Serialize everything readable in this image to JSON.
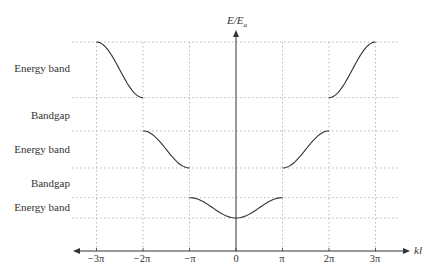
{
  "chart_data": {
    "type": "line",
    "title": "",
    "xlabel": "kl",
    "ylabel": "E/E_a",
    "x_ticks": [
      "−3π",
      "−2π",
      "−π",
      "0",
      "π",
      "2π",
      "3π"
    ],
    "x_tick_values": [
      -3,
      -2,
      -1,
      0,
      1,
      2,
      3
    ],
    "x_unit": "π",
    "grid": "dotted",
    "row_labels": [
      "Energy band",
      "Bandgap",
      "Energy band",
      "Bandgap",
      "Energy band"
    ],
    "energy_levels_relative": {
      "band3_top": 1.0,
      "band3_bottom": 0.7,
      "band2_top": 0.52,
      "band2_bottom": 0.32,
      "band1_top": 0.16,
      "band1_bottom": 0.05
    },
    "series": [
      {
        "name": "Band 1 (first zone)",
        "x_pi": [
          -1,
          0,
          1
        ],
        "shape": "cosine",
        "y_rel": [
          0.16,
          0.05,
          0.16
        ]
      },
      {
        "name": "Band 2 (left)",
        "x_pi": [
          -2,
          -1
        ],
        "shape": "cosine",
        "y_rel": [
          0.52,
          0.32
        ]
      },
      {
        "name": "Band 2 (right)",
        "x_pi": [
          1,
          2
        ],
        "shape": "cosine",
        "y_rel": [
          0.32,
          0.52
        ]
      },
      {
        "name": "Band 3 (left)",
        "x_pi": [
          -3,
          -2
        ],
        "shape": "cosine",
        "y_rel": [
          1.0,
          0.7
        ]
      },
      {
        "name": "Band 3 (right)",
        "x_pi": [
          2,
          3
        ],
        "shape": "cosine",
        "y_rel": [
          0.7,
          1.0
        ]
      }
    ]
  },
  "labels": {
    "y_axis_main": "E/E",
    "y_axis_sub": "a",
    "x_axis": "kl",
    "rows": [
      {
        "text": "Energy band",
        "y": 68
      },
      {
        "text": "Bandgap",
        "y": 115
      },
      {
        "text": "Energy band",
        "y": 149
      },
      {
        "text": "Bandgap",
        "y": 183
      },
      {
        "text": "Energy band",
        "y": 207
      }
    ],
    "ticks": [
      "−3π",
      "−2π",
      "−π",
      "0",
      "π",
      "2π",
      "3π"
    ]
  },
  "colors": {
    "curve": "#333333",
    "axis": "#333333",
    "grid": "#aaaaaa"
  }
}
